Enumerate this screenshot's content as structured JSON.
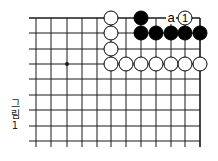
{
  "figure": {
    "caption_lines": [
      "그",
      "림",
      "1"
    ],
    "caption": "그림 1"
  },
  "board": {
    "columns_x": [
      36,
      51,
      67,
      82,
      97,
      111,
      126,
      141,
      156,
      171,
      185,
      200
    ],
    "rows_y": [
      18,
      33,
      49,
      64,
      79,
      95,
      110,
      126,
      141
    ],
    "line_left_x": 29,
    "line_bottom_y": 147,
    "top_edge": true,
    "right_edge": true,
    "star_points": [
      {
        "col": 3,
        "row": 4
      }
    ],
    "stone_radius": 7,
    "colors": {
      "line": "#1a1a1a",
      "black": "#000000",
      "white": "#ffffff"
    },
    "stones": [
      {
        "color": "white",
        "col": 6,
        "row": 1
      },
      {
        "color": "white",
        "col": 6,
        "row": 2
      },
      {
        "color": "white",
        "col": 6,
        "row": 3
      },
      {
        "color": "white",
        "col": 6,
        "row": 4
      },
      {
        "color": "white",
        "col": 7,
        "row": 4
      },
      {
        "color": "white",
        "col": 8,
        "row": 4
      },
      {
        "color": "white",
        "col": 9,
        "row": 4
      },
      {
        "color": "white",
        "col": 10,
        "row": 4
      },
      {
        "color": "white",
        "col": 11,
        "row": 4
      },
      {
        "color": "white",
        "col": 12,
        "row": 4
      },
      {
        "color": "black",
        "col": 8,
        "row": 1
      },
      {
        "color": "black",
        "col": 8,
        "row": 2
      },
      {
        "color": "black",
        "col": 9,
        "row": 2
      },
      {
        "color": "black",
        "col": 10,
        "row": 2
      },
      {
        "color": "black",
        "col": 11,
        "row": 2
      },
      {
        "color": "black",
        "col": 12,
        "row": 2
      },
      {
        "color": "white",
        "col": 11,
        "row": 1,
        "label": "1"
      }
    ],
    "markers": [
      {
        "col": 10,
        "row": 1,
        "label": "a"
      }
    ]
  }
}
